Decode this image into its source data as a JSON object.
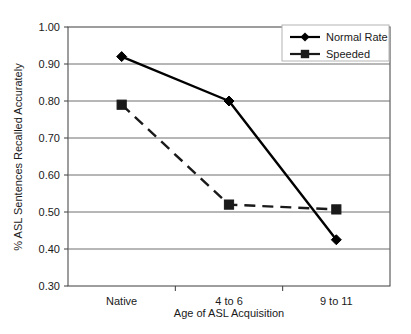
{
  "chart_data": {
    "type": "line",
    "title": "",
    "xlabel": "Age of ASL Acquisition",
    "ylabel": "% ASL Sentences Recalled Accurately",
    "categories": [
      "Native",
      "4 to 6",
      "9 to 11"
    ],
    "ylim": [
      0.3,
      1.0
    ],
    "ytick_labels": [
      "1.00",
      "0.90",
      "0.80",
      "0.70",
      "0.60",
      "0.50",
      "0.40",
      "0.30"
    ],
    "ytick_values": [
      1.0,
      0.9,
      0.8,
      0.7,
      0.6,
      0.5,
      0.4,
      0.3
    ],
    "grid": true,
    "legend_position": "top-right",
    "series": [
      {
        "name": "Normal Rate",
        "marker": "diamond",
        "line_style": "solid",
        "color": "#000000",
        "values": [
          0.92,
          0.8,
          0.425
        ]
      },
      {
        "name": "Speeded",
        "marker": "square",
        "line_style": "dashed",
        "color": "#1a1a1a",
        "values": [
          0.79,
          0.52,
          0.507
        ]
      }
    ]
  },
  "legend": {
    "items": [
      {
        "label": "Normal Rate",
        "marker": "diamond-marker-icon"
      },
      {
        "label": "Speeded",
        "marker": "square-marker-icon"
      }
    ]
  },
  "axes": {
    "x_title": "Age of ASL Acquisition",
    "y_title": "% ASL Sentences Recalled Accurately"
  },
  "colors": {
    "axis": "#3c3c3c",
    "grid": "#6e6e6e",
    "series_primary": "#000000",
    "series_secondary": "#1a1a1a",
    "background": "#ffffff"
  }
}
